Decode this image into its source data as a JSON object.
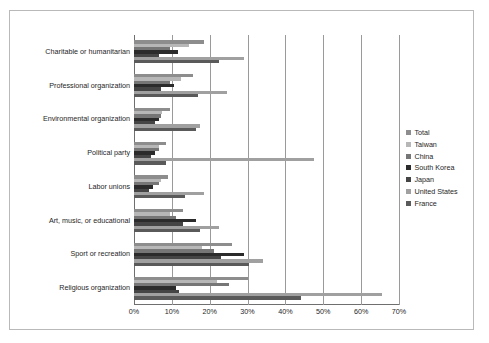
{
  "chart_data": {
    "type": "bar",
    "orientation": "horizontal",
    "title": "",
    "xlabel": "",
    "ylabel": "",
    "xlim": [
      0,
      70
    ],
    "xticks": [
      "0%",
      "10%",
      "20%",
      "30%",
      "40%",
      "50%",
      "60%",
      "70%"
    ],
    "xtick_values": [
      0,
      10,
      20,
      30,
      40,
      50,
      60,
      70
    ],
    "grid": true,
    "legend_position": "right",
    "categories": [
      "Charitable or humanitarian",
      "Professional organization",
      "Environmental organization",
      "Political party",
      "Labor unions",
      "Art, music, or educational",
      "Sport or recreation",
      "Religious organization"
    ],
    "series": [
      {
        "name": "Total",
        "color": "#8d8d8d",
        "values": [
          18.5,
          15.5,
          9.5,
          8.5,
          9.0,
          13.0,
          26.0,
          30.0
        ]
      },
      {
        "name": "Taiwan",
        "color": "#b7b7b7",
        "values": [
          14.5,
          12.5,
          7.5,
          6.5,
          7.0,
          9.5,
          18.0,
          22.0
        ]
      },
      {
        "name": "China",
        "color": "#767676",
        "values": [
          9.5,
          9.5,
          7.0,
          6.5,
          6.5,
          11.0,
          21.0,
          25.0
        ]
      },
      {
        "name": "South Korea",
        "color": "#2b2b2b",
        "values": [
          11.5,
          10.5,
          6.5,
          5.5,
          5.0,
          16.5,
          29.0,
          11.0
        ]
      },
      {
        "name": "Japan",
        "color": "#454545",
        "values": [
          6.5,
          7.0,
          5.5,
          4.5,
          4.0,
          13.0,
          23.0,
          12.0
        ]
      },
      {
        "name": "United States",
        "color": "#a0a0a0",
        "values": [
          29.0,
          24.5,
          17.5,
          47.5,
          18.5,
          22.5,
          34.0,
          65.5
        ]
      },
      {
        "name": "France",
        "color": "#5a5a5a",
        "values": [
          22.5,
          17.0,
          16.5,
          8.5,
          13.5,
          17.5,
          30.5,
          44.0
        ]
      }
    ]
  },
  "legend": {
    "items": [
      {
        "label": "Total"
      },
      {
        "label": "Taiwan"
      },
      {
        "label": "China"
      },
      {
        "label": "South Korea"
      },
      {
        "label": "Japan"
      },
      {
        "label": "United States"
      },
      {
        "label": "France"
      }
    ]
  }
}
